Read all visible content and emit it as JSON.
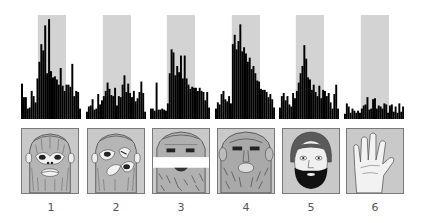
{
  "figure": {
    "stimulus_window_color": "#d3d3d3",
    "bar_color": "#000000",
    "image_background": "#c9c9c9"
  },
  "chart_data": {
    "type": "bar",
    "title": "",
    "xlabel": "",
    "ylabel": "",
    "ylim": [
      0,
      1
    ],
    "stimulus_window_fraction": [
      0.28,
      0.75
    ],
    "panels": [
      {
        "label": "1",
        "stimulus": "monkey face",
        "values": [
          0.34,
          0.21,
          0.21,
          0.1,
          0.11,
          0.27,
          0.22,
          0.16,
          0.39,
          0.55,
          0.72,
          0.66,
          0.9,
          0.44,
          0.96,
          0.46,
          0.4,
          0.41,
          0.38,
          0.33,
          0.49,
          0.32,
          0.27,
          0.33,
          0.33,
          0.31,
          0.53,
          0.22,
          0.27,
          0.26,
          0.1
        ]
      },
      {
        "label": "2",
        "stimulus": "scrambled monkey face",
        "values": [
          0.07,
          0.12,
          0.13,
          0.19,
          0.09,
          0.1,
          0.24,
          0.14,
          0.18,
          0.22,
          0.27,
          0.35,
          0.29,
          0.23,
          0.22,
          0.3,
          0.13,
          0.22,
          0.21,
          0.33,
          0.42,
          0.26,
          0.34,
          0.25,
          0.21,
          0.27,
          0.17,
          0.2,
          0.26,
          0.36,
          0.25,
          0.07
        ]
      },
      {
        "label": "3",
        "stimulus": "monkey face with eyes masked out",
        "values": [
          0.1,
          0.1,
          0.08,
          0.35,
          0.09,
          0.09,
          0.1,
          0.09,
          0.08,
          0.15,
          0.44,
          0.67,
          0.64,
          0.42,
          0.51,
          0.45,
          0.61,
          0.39,
          0.61,
          0.39,
          0.33,
          0.29,
          0.31,
          0.3,
          0.3,
          0.27,
          0.3,
          0.27,
          0.26,
          0.18,
          0.26,
          0.11
        ]
      },
      {
        "label": "4",
        "stimulus": "rhesus monkey face",
        "values": [
          0.1,
          0.16,
          0.14,
          0.24,
          0.27,
          0.19,
          0.17,
          0.22,
          0.15,
          0.72,
          0.81,
          0.67,
          0.75,
          0.91,
          0.65,
          0.69,
          0.63,
          0.55,
          0.59,
          0.48,
          0.51,
          0.44,
          0.37,
          0.36,
          0.29,
          0.28,
          0.28,
          0.26,
          0.21,
          0.24,
          0.19,
          0.11
        ]
      },
      {
        "label": "5",
        "stimulus": "human face",
        "values": [
          0.11,
          0.22,
          0.25,
          0.18,
          0.22,
          0.14,
          0.12,
          0.25,
          0.2,
          0.27,
          0.35,
          0.44,
          0.51,
          0.71,
          0.58,
          0.4,
          0.38,
          0.28,
          0.33,
          0.26,
          0.22,
          0.32,
          0.2,
          0.28,
          0.27,
          0.22,
          0.25,
          0.16,
          0.1,
          0.24,
          0.33,
          0.1
        ]
      },
      {
        "label": "6",
        "stimulus": "hand",
        "values": [
          0.05,
          0.15,
          0.12,
          0.06,
          0.1,
          0.08,
          0.06,
          0.08,
          0.06,
          0.1,
          0.13,
          0.14,
          0.21,
          0.09,
          0.1,
          0.19,
          0.2,
          0.1,
          0.13,
          0.12,
          0.1,
          0.15,
          0.14,
          0.06,
          0.13,
          0.14,
          0.07,
          0.12,
          0.06,
          0.15,
          0.07,
          0.12
        ]
      }
    ]
  },
  "labels": [
    "1",
    "2",
    "3",
    "4",
    "5",
    "6"
  ]
}
